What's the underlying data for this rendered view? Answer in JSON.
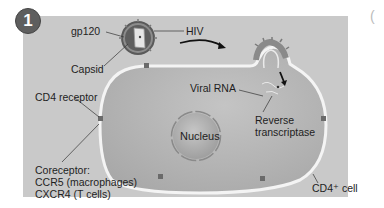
{
  "step_badge": "1",
  "labels": {
    "gp120": "gp120",
    "hiv": "HIV",
    "capsid": "Capsid",
    "cd4_receptor": "CD4 receptor",
    "viral_rna": "Viral RNA",
    "reverse_transcriptase_line1": "Reverse",
    "reverse_transcriptase_line2": "transcriptase",
    "nucleus": "Nucleus",
    "coreceptor_line1": "Coreceptor:",
    "coreceptor_line2": "CCR5 (macrophages)",
    "coreceptor_line3": "CXCR4 (T cells)",
    "cd4_cell": "CD4⁺ cell"
  },
  "partial_next_panel_glyph": "(",
  "colors": {
    "panel_bg": "#c9c9c9",
    "cell_fill": "#b3b3b3",
    "membrane": "#f4f4f4",
    "receptor": "#6a6a6a",
    "text": "#1e1e1e"
  }
}
